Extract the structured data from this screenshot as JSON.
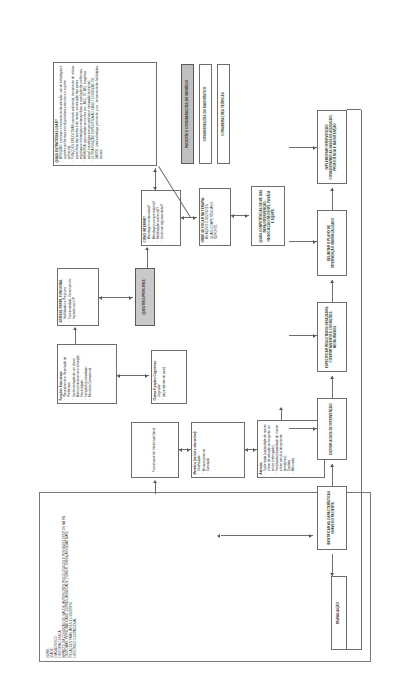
{
  "figure": {
    "caption_line1": "Figura 3 – O mapa mental para a estruturação do raciocínio",
    "caption_line2": "clínico para intervenção em RN na Psiquiatria"
  },
  "colors": {
    "ink": "#2e2e2e",
    "stroke": "#6d6d6d",
    "shade": "#bfbfbf",
    "paper": "#ffffff"
  },
  "headers": {
    "patient_considerations": "PACIENTE E CONSIDERAÇÕES DO INDIVÍDUO",
    "diagnosis_considerations": "CONSIDERAÇÕES DO DIAGNÓSTICO",
    "theoretical_considerations": "CONSIDERAÇÕES TEÓRICAS"
  },
  "intake": {
    "title": "",
    "lines": [
      "NOME:",
      "IDADE:",
      "DIAGNÓSTICO:",
      "HISTÓRIA CLÍNICA:",
      "IMPACTO DA CONDIÇÃO DE SAÚDE, ANTERIORES PSICOLÓGICOS E POSSÍVEIS EFEITOS NA RN",
      "(SINTOMAS, PERSONALIDADE, COPING, ANSIEDADE, HUMOR, CRENÇAS NEGATIVAS)",
      "RELAÇÕES FAMILIARES E CONTEXTO:",
      "HISTÓRICO OCUPACIONAL:"
    ]
  },
  "assessment": {
    "intellectual": {
      "title": "Funcionamento Intelectual Geral",
      "items": []
    },
    "memory": {
      "title": "Memória (verbal e não verbal)",
      "items": [
        "Codificação;",
        "Armazenamento;",
        "Evocação."
      ]
    },
    "attention": {
      "title": "Atenção",
      "items": [
        "Sustentada (capacidade de manter o foco de atenção ao longo de um tempo prolongado);",
        "Focalizada (capacidade de manter o foco atento a despeito de distratores);",
        "Dividida;",
        "Alternada."
      ]
    },
    "executive": {
      "title": "Funções Executivas",
      "items": [
        "Planejamento e Resolução de Problemas;",
        "Implementação de um plano;",
        "Automonitoramento e correção;",
        "Flexibilidade;",
        "Inibição/Impulsividade;",
        "Memória Operacional."
      ]
    },
    "other_cognitive": {
      "title": "Outras Funções Cognitivas",
      "items": [
        "Cognição",
        "(dependendo do caso)"
      ]
    }
  },
  "synthesis": {
    "title": "SÍNTESE PERFIL FUNCIONAL",
    "items": [
      "Habilidades e Prejuízos",
      "Funcionalidade, Desempenho",
      "Impacto nas OP"
    ]
  },
  "quest_principles": {
    "label": "QUESTÕES PRINCIPAIS"
  },
  "how_to_intervene": {
    "title": "COMO INTERVIR?",
    "items": [
      "Abordagem restaurativa?",
      "Abordagem compensatória?",
      "Modificação ambiental?",
      "Combinar algumas delas?"
    ]
  },
  "where_focus": {
    "title": "ONDE SE FOCAR NA TERAPIA:",
    "items": [
      "AS AÇÕES E DECISÕES;",
      "QUAIS COMPETÊNCIAS E SUPORTE."
    ]
  },
  "competences": {
    "title": "QUAIS COMPETÊNCIAS DE ME DAS PARA INTERVENÇÃO - NEGOCIAÇÃO PACIENTE, FAMÍLIA E EQUIPE"
  },
  "strategies": {
    "title": "QUAIS ESTRATÉGIAS USAR?",
    "items": [
      "ATENÇÃO: promover o treinamento de atenção, uso de estratégias e suportes ambientais e os dispositivos externos e o suporte ambiental;",
      "FUNÇÕES EXECUTIVAS: controle ambiental, treinamento de rotinas específicas das tarefas e de metas, a execução das partes cognitivas e estratégias metacognitivas, a resolução de problemas;",
      "MEMÓRIA: aprendizado sem erros (ex.: AEC, TE, AE), imagética visual, estratégias compensatórias e motivação ambiental;",
      "OUTRA FUNÇÃO ESPECÍFICA AO CASO / CONDIÇÃO DE SAÚDE: uma estratégia pertinente, p.ex., treinamento de habilidades sociais."
    ]
  },
  "plan": {
    "identify_key": "IDENTIFICAR AS CARACTERÍSTICAS CHAVE DO PACIENTE",
    "define_targets": "DEFINIR ALVOS DE INTERVENÇÃO",
    "specify_results": "ESPECIFICAR RESULTADOS DESEJADOS: COMPORTAMENTO E COGNIÇÕES MENSURÁVEIS",
    "delimit_plan": "DELIMITAR O PLANO DE INTERVENÇÃO INDIVIDUALIZADO",
    "implement": "IMPLEMENTAR INTERVENÇÃO CONSIDERANDO AS FASES DE AQUISIÇÃO, PROFICIÊNCIA E MANUTENÇÃO"
  },
  "reassessment": {
    "label": "REAVALIAÇÃO"
  }
}
